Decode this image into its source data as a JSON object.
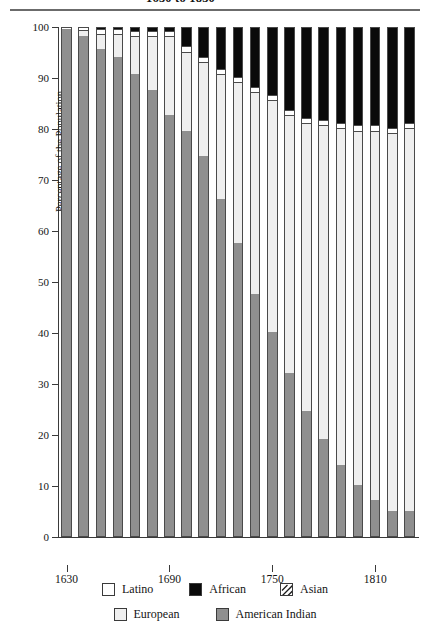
{
  "title": {
    "text": "1630 to 1830",
    "note": "partially cropped at top edge of screenshot"
  },
  "axes": {
    "y_title": "Percentage of the Population",
    "y_ticks": [
      "0",
      "10",
      "20",
      "30",
      "40",
      "50",
      "60",
      "70",
      "80",
      "90",
      "100"
    ],
    "x_ticks": [
      "1630",
      "1690",
      "1750",
      "1810"
    ]
  },
  "legend": {
    "row1": [
      {
        "label": "Latino",
        "swatch": "latino-swatch",
        "color": "#ffffff"
      },
      {
        "label": "African",
        "swatch": "african-swatch",
        "color": "#0a0a0a"
      },
      {
        "label": "Asian",
        "swatch": "asian-swatch",
        "color": "#ffffff"
      }
    ],
    "row2": [
      {
        "label": "European",
        "swatch": "european-swatch",
        "color": "#efefef"
      },
      {
        "label": "American Indian",
        "swatch": "amerindian-swatch",
        "color": "#8f8f8f"
      }
    ]
  },
  "chart_data": {
    "type": "bar",
    "stacked": true,
    "title": "1630 to 1830",
    "xlabel": "",
    "ylabel": "Percentage of the Population",
    "ylim": [
      0,
      100
    ],
    "xtick_labels": [
      "1630",
      "1690",
      "1750",
      "1810"
    ],
    "grid": false,
    "legend_position": "bottom",
    "categories": [
      "1630",
      "1640",
      "1650",
      "1660",
      "1670",
      "1680",
      "1690",
      "1700",
      "1710",
      "1720",
      "1730",
      "1740",
      "1750",
      "1760",
      "1770",
      "1780",
      "1790",
      "1800",
      "1810",
      "1820",
      "1830"
    ],
    "series": [
      {
        "name": "American Indian",
        "color": "#8f8f8f",
        "values": [
          99.5,
          98.0,
          95.5,
          94.0,
          90.5,
          87.5,
          82.5,
          79.5,
          74.5,
          66.0,
          57.5,
          47.5,
          40.0,
          32.0,
          24.5,
          19.0,
          14.0,
          10.0,
          7.0,
          5.0,
          5.0
        ]
      },
      {
        "name": "European",
        "color": "#efefef",
        "values": [
          0.0,
          1.3,
          3.0,
          4.5,
          7.5,
          10.5,
          15.5,
          15.5,
          18.5,
          24.5,
          31.5,
          39.5,
          45.5,
          50.5,
          56.5,
          61.5,
          66.0,
          69.5,
          72.5,
          74.0,
          75.0
        ]
      },
      {
        "name": "Latino",
        "color": "#ffffff",
        "values": [
          0.5,
          0.7,
          1.0,
          1.0,
          1.0,
          1.0,
          1.0,
          1.0,
          1.0,
          1.0,
          1.0,
          1.0,
          1.0,
          1.0,
          1.0,
          1.0,
          1.0,
          1.0,
          1.0,
          1.0,
          1.0
        ]
      },
      {
        "name": "African",
        "color": "#0a0a0a",
        "values": [
          0.0,
          0.0,
          0.5,
          0.5,
          1.0,
          1.0,
          1.0,
          4.0,
          6.0,
          8.5,
          10.0,
          12.0,
          13.5,
          16.5,
          18.0,
          18.5,
          19.0,
          19.5,
          19.5,
          20.0,
          19.0
        ]
      },
      {
        "name": "Asian",
        "color": "#ffffff",
        "values": [
          0,
          0,
          0,
          0,
          0,
          0,
          0,
          0,
          0,
          0,
          0,
          0,
          0,
          0,
          0,
          0,
          0,
          0,
          0,
          0,
          0
        ]
      }
    ]
  }
}
